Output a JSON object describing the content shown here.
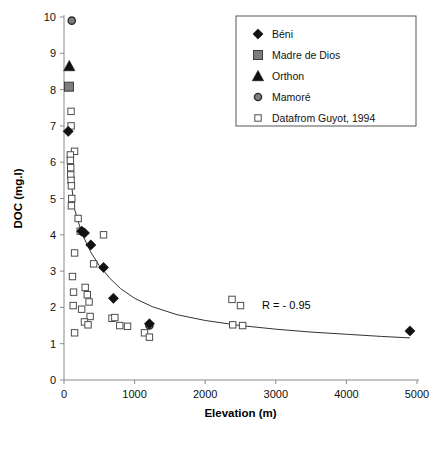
{
  "chart_data": {
    "type": "scatter",
    "title": "",
    "xlabel": "Elevation (m)",
    "ylabel": "DOC (mg.l)",
    "xlim": [
      0,
      5000
    ],
    "ylim": [
      0,
      10
    ],
    "xticks": [
      0,
      1000,
      2000,
      3000,
      4000,
      5000
    ],
    "yticks": [
      0,
      1,
      2,
      3,
      4,
      5,
      6,
      7,
      8,
      9,
      10
    ],
    "xticklabels": [
      "0",
      "1000",
      "2000",
      "3000",
      "4000",
      "5000"
    ],
    "yticklabels": [
      "0",
      "1",
      "2",
      "3",
      "4",
      "5",
      "6",
      "7",
      "8",
      "9",
      "10"
    ],
    "grid": false,
    "legend_position": "top-right",
    "annotations": [
      {
        "text": "R = - 0.95",
        "x": 3150,
        "y": 1.95
      }
    ],
    "series": [
      {
        "name": "Béni",
        "marker": "filled-diamond",
        "color": "#111111",
        "points": [
          {
            "x": 60,
            "y": 6.85
          },
          {
            "x": 250,
            "y": 4.1
          },
          {
            "x": 290,
            "y": 4.05
          },
          {
            "x": 380,
            "y": 3.72
          },
          {
            "x": 560,
            "y": 3.1
          },
          {
            "x": 700,
            "y": 2.25
          },
          {
            "x": 1210,
            "y": 1.55
          },
          {
            "x": 4900,
            "y": 1.35
          }
        ]
      },
      {
        "name": "Madre de Dios",
        "marker": "filled-square",
        "color": "#7d7d7d",
        "points": [
          {
            "x": 70,
            "y": 8.08
          }
        ]
      },
      {
        "name": "Orthon",
        "marker": "filled-triangle",
        "color": "#111111",
        "points": [
          {
            "x": 75,
            "y": 8.65
          }
        ]
      },
      {
        "name": "Mamoré",
        "marker": "filled-circle",
        "color": "#7d7d7d",
        "points": [
          {
            "x": 110,
            "y": 9.9
          },
          {
            "x": 1210,
            "y": 1.5
          }
        ]
      },
      {
        "name": "Datafrom Guyot, 1994",
        "marker": "open-square",
        "color": "#ffffff",
        "points": [
          {
            "x": 100,
            "y": 7.4
          },
          {
            "x": 100,
            "y": 7.0
          },
          {
            "x": 150,
            "y": 6.3
          },
          {
            "x": 90,
            "y": 6.2
          },
          {
            "x": 90,
            "y": 6.05
          },
          {
            "x": 95,
            "y": 5.85
          },
          {
            "x": 95,
            "y": 5.65
          },
          {
            "x": 100,
            "y": 5.5
          },
          {
            "x": 105,
            "y": 5.35
          },
          {
            "x": 110,
            "y": 5.0
          },
          {
            "x": 105,
            "y": 4.8
          },
          {
            "x": 200,
            "y": 4.45
          },
          {
            "x": 230,
            "y": 4.1
          },
          {
            "x": 150,
            "y": 3.5
          },
          {
            "x": 560,
            "y": 4.0
          },
          {
            "x": 420,
            "y": 3.2
          },
          {
            "x": 120,
            "y": 2.85
          },
          {
            "x": 135,
            "y": 2.42
          },
          {
            "x": 300,
            "y": 2.55
          },
          {
            "x": 330,
            "y": 2.35
          },
          {
            "x": 355,
            "y": 2.15
          },
          {
            "x": 130,
            "y": 2.05
          },
          {
            "x": 250,
            "y": 1.95
          },
          {
            "x": 370,
            "y": 1.75
          },
          {
            "x": 290,
            "y": 1.6
          },
          {
            "x": 340,
            "y": 1.52
          },
          {
            "x": 150,
            "y": 1.3
          },
          {
            "x": 680,
            "y": 1.7
          },
          {
            "x": 720,
            "y": 1.72
          },
          {
            "x": 790,
            "y": 1.5
          },
          {
            "x": 900,
            "y": 1.48
          },
          {
            "x": 1140,
            "y": 1.3
          },
          {
            "x": 1210,
            "y": 1.18
          },
          {
            "x": 2380,
            "y": 2.22
          },
          {
            "x": 2500,
            "y": 2.05
          },
          {
            "x": 2390,
            "y": 1.52
          },
          {
            "x": 2530,
            "y": 1.5
          }
        ]
      }
    ],
    "trendline": {
      "label": "power-fit",
      "r": -0.95,
      "points": [
        {
          "x": 95,
          "y": 5.55
        },
        {
          "x": 150,
          "y": 4.7
        },
        {
          "x": 250,
          "y": 4.05
        },
        {
          "x": 380,
          "y": 3.52
        },
        {
          "x": 500,
          "y": 3.15
        },
        {
          "x": 650,
          "y": 2.8
        },
        {
          "x": 800,
          "y": 2.52
        },
        {
          "x": 1000,
          "y": 2.25
        },
        {
          "x": 1250,
          "y": 2.02
        },
        {
          "x": 1600,
          "y": 1.8
        },
        {
          "x": 2000,
          "y": 1.64
        },
        {
          "x": 2500,
          "y": 1.5
        },
        {
          "x": 3000,
          "y": 1.4
        },
        {
          "x": 3500,
          "y": 1.32
        },
        {
          "x": 4000,
          "y": 1.26
        },
        {
          "x": 4500,
          "y": 1.2
        },
        {
          "x": 4900,
          "y": 1.16
        }
      ]
    },
    "legend": {
      "entries": [
        {
          "label": "Béni",
          "marker": "filled-diamond"
        },
        {
          "label": "Madre de Dios",
          "marker": "filled-square"
        },
        {
          "label": "Orthon",
          "marker": "filled-triangle"
        },
        {
          "label": "Mamoré",
          "marker": "filled-circle"
        },
        {
          "label": "Datafrom Guyot, 1994",
          "marker": "open-square"
        }
      ]
    }
  }
}
